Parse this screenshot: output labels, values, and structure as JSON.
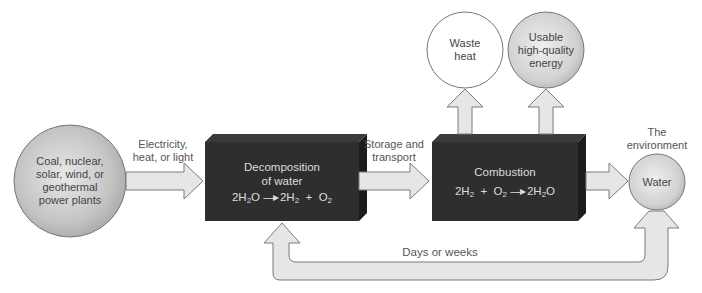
{
  "diagram": {
    "type": "flow",
    "source": {
      "label": "Coal, nuclear, solar, wind, or geothermal power plants",
      "lines": [
        "Coal, nuclear,",
        "solar, wind, or",
        "geothermal",
        "power plants"
      ]
    },
    "arrow_1_label": [
      "Electricity,",
      "heat, or light"
    ],
    "decomposition": {
      "title_lines": [
        "Decomposition",
        "of water"
      ],
      "equation": {
        "lhs": "2H",
        "lhs_sub": "2",
        "lhs_tail": "O",
        "rhs1": "2H",
        "rhs1_sub": "2",
        "plus": "+",
        "rhs2": "O",
        "rhs2_sub": "2"
      }
    },
    "arrow_2_label": [
      "Storage and",
      "transport"
    ],
    "combustion": {
      "title": "Combustion",
      "equation": {
        "r1": "2H",
        "r1_sub": "2",
        "plus": "+",
        "r2": "O",
        "r2_sub": "2",
        "p": "2H",
        "p_sub": "2",
        "p_tail": "O"
      }
    },
    "outputs": [
      {
        "label_lines": [
          "Waste",
          "heat"
        ],
        "fill": "#ffffff"
      },
      {
        "label_lines": [
          "Usable",
          "high-quality",
          "energy"
        ],
        "fill": "#d9d9d9"
      }
    ],
    "environment_label": [
      "The",
      "environment"
    ],
    "water": {
      "label": "Water"
    },
    "return_label": "Days or weeks",
    "colors": {
      "box_fill": "#2b2b2b",
      "box_side": "#1a1a1a",
      "arrow_fill": "#e6e6e6",
      "arrow_stroke": "#7a7a7a",
      "sphere_fill": "#c8c8c8"
    }
  }
}
